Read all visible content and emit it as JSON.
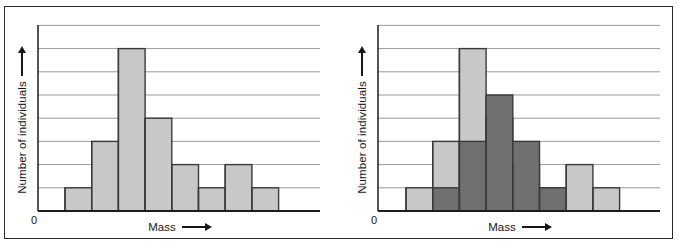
{
  "figure": {
    "title": "",
    "panel_count": 2,
    "frame_color": "#2b2b2b",
    "background": "#ffffff"
  },
  "colors": {
    "bar_light": "#c8c8c8",
    "bar_dark": "#707070",
    "bar_outline": "#3a3a3a",
    "gridline": "#9a9a9a",
    "axis": "#1d1d1d",
    "text": "#171717"
  },
  "panels": [
    {
      "id": "left-histogram",
      "ylabel": "Number of individuals",
      "xlabel": "Mass",
      "origin_label": "0",
      "y_arrow": true,
      "x_arrow": true
    },
    {
      "id": "right-histogram",
      "ylabel": "Number of individuals",
      "xlabel": "Mass",
      "origin_label": "0",
      "y_arrow": true,
      "x_arrow": true
    }
  ],
  "chart_data": [
    {
      "type": "bar",
      "id": "left-histogram",
      "title": "",
      "xlabel": "Mass",
      "ylabel": "Number of individuals",
      "xlim": [
        0,
        9
      ],
      "ylim": [
        0,
        9
      ],
      "grid": true,
      "gridlines_y": [
        1,
        2,
        3,
        4,
        5,
        6,
        7,
        8
      ],
      "tick_labels_x": [
        "0"
      ],
      "tick_labels_y": [],
      "legend": [],
      "categories": [
        "1",
        "2",
        "3",
        "4",
        "5",
        "6",
        "7",
        "8"
      ],
      "values": [
        1,
        3,
        7,
        4,
        2,
        1,
        2,
        1
      ],
      "series": [
        {
          "name": "All individuals",
          "color": "#c8c8c8",
          "values": [
            1,
            3,
            7,
            4,
            2,
            1,
            2,
            1
          ]
        }
      ],
      "annotations": []
    },
    {
      "type": "bar",
      "id": "right-histogram",
      "title": "",
      "xlabel": "Mass",
      "ylabel": "Number of individuals",
      "xlim": [
        0,
        9
      ],
      "ylim": [
        0,
        9
      ],
      "grid": true,
      "gridlines_y": [
        1,
        2,
        3,
        4,
        5,
        6,
        7,
        8
      ],
      "tick_labels_x": [
        "0"
      ],
      "tick_labels_y": [],
      "legend": [],
      "categories": [
        "1",
        "2",
        "3",
        "4",
        "5",
        "6",
        "7",
        "8"
      ],
      "values": [
        1,
        3,
        7,
        4,
        2,
        1,
        2,
        1
      ],
      "series": [
        {
          "name": "Total individuals",
          "color": "#c8c8c8",
          "values": [
            1,
            3,
            7,
            4,
            2,
            1,
            2,
            1
          ]
        },
        {
          "name": "Surviving individuals",
          "color": "#707070",
          "values": [
            0,
            1,
            3,
            5,
            3,
            1,
            0,
            0
          ]
        }
      ],
      "annotations": []
    }
  ],
  "geometry": {
    "baseline_y": 211,
    "plot_top_y": 25,
    "gridline_spacing": 23.2,
    "bar_width": 26.7,
    "left_axis_x": 38,
    "left_bars_start_x": 65,
    "right_axis_x": 378,
    "right_bars_start_x": 406,
    "plot_right_x_left_panel": 320,
    "plot_right_x_right_panel": 660
  }
}
